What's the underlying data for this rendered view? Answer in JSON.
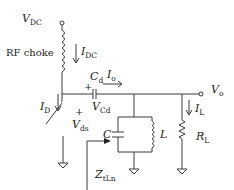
{
  "diagram": {
    "labels": {
      "vdc": {
        "main": "V",
        "sub": "DC"
      },
      "rf_choke": "RF choke",
      "idc": {
        "main": "I",
        "sub": "DC"
      },
      "cd": {
        "main": "C",
        "sub": "d"
      },
      "io": {
        "main": "I",
        "sub": "o"
      },
      "vo": {
        "main": "V",
        "sub": "o"
      },
      "id": {
        "main": "I",
        "sub": "D"
      },
      "vds": {
        "main": "V",
        "sub": "ds"
      },
      "vcd": {
        "main": "V",
        "sub": "Cd"
      },
      "plus_cd": "+",
      "plus_vds": "+",
      "c": "C",
      "l": "L",
      "il": {
        "main": "I",
        "sub": "L"
      },
      "rl": {
        "main": "R",
        "sub": "L"
      },
      "zt": {
        "main": "Z",
        "sub": "tLn"
      }
    },
    "components": [
      {
        "name": "DC supply terminal",
        "label": "VDC"
      },
      {
        "name": "RF choke inductor",
        "label": "RF choke"
      },
      {
        "name": "switch",
        "label": "transistor switch"
      },
      {
        "name": "DC blocking capacitor",
        "label": "Cd"
      },
      {
        "name": "parallel resonator capacitor",
        "label": "C"
      },
      {
        "name": "parallel resonator inductor",
        "label": "L"
      },
      {
        "name": "load resistor",
        "label": "RL"
      },
      {
        "name": "output terminal",
        "label": "Vo"
      }
    ],
    "colors": {
      "line": "#3a3a3a",
      "text": "#222222",
      "background": "#ffffff"
    }
  }
}
